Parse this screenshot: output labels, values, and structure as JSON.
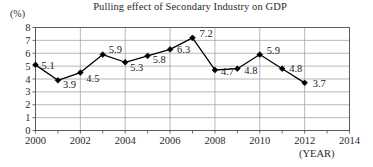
{
  "chart_data": {
    "type": "line",
    "title": "Pulling effect of Secondary Industry on GDP",
    "xlabel": "(YEAR)",
    "ylabel": "(%)",
    "x": [
      2000,
      2001,
      2002,
      2003,
      2004,
      2005,
      2006,
      2007,
      2008,
      2009,
      2010,
      2011,
      2012
    ],
    "values": [
      5.1,
      3.9,
      4.5,
      5.9,
      5.3,
      5.8,
      6.3,
      7.2,
      4.7,
      4.8,
      5.9,
      4.8,
      3.7
    ],
    "point_labels": [
      "5.1",
      "3.9",
      "4.5",
      "5.9",
      "5.3",
      "5.8",
      "6.3",
      "7.2",
      "4.7",
      "4.8",
      "5.9",
      "4.8",
      "3.7"
    ],
    "xticks": [
      "2000",
      "2002",
      "2004",
      "2006",
      "2008",
      "2010",
      "2012",
      "2014"
    ],
    "xtick_values": [
      2000,
      2002,
      2004,
      2006,
      2008,
      2010,
      2012,
      2014
    ],
    "yticks": [
      "0",
      "1",
      "2",
      "3",
      "4",
      "5",
      "6",
      "7",
      "8"
    ],
    "ytick_values": [
      0,
      1,
      2,
      3,
      4,
      5,
      6,
      7,
      8
    ],
    "xlim": [
      2000,
      2014
    ],
    "ylim": [
      0,
      8
    ],
    "grid": true,
    "legend": false,
    "series_color": "#000000",
    "grid_color": "#999999",
    "marker": "diamond"
  }
}
